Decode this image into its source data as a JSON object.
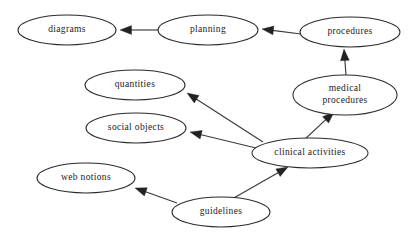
{
  "diagram": {
    "type": "directed-graph",
    "background_color": "#ffffff",
    "node_fill_color": "#ffffff",
    "node_stroke_color": "#2b2b2b",
    "edge_color": "#3a3a3a",
    "text_color": "#1a1a1a",
    "nodes": [
      {
        "id": "diagrams",
        "label": "diagrams",
        "lines": [
          "diagrams"
        ],
        "cx": 67,
        "cy": 30,
        "rx": 49,
        "ry": 15
      },
      {
        "id": "planning",
        "label": "planning",
        "lines": [
          "planning"
        ],
        "cx": 208,
        "cy": 30,
        "rx": 50,
        "ry": 15
      },
      {
        "id": "procedures",
        "label": "procedures",
        "lines": [
          "procedures"
        ],
        "cx": 350,
        "cy": 32,
        "rx": 50,
        "ry": 15
      },
      {
        "id": "medical-procedures",
        "label": "medical procedures",
        "lines": [
          "medical",
          "procedures"
        ],
        "cx": 345,
        "cy": 95,
        "rx": 52,
        "ry": 20
      },
      {
        "id": "quantities",
        "label": "quantities",
        "lines": [
          "quantities"
        ],
        "cx": 135,
        "cy": 85,
        "rx": 50,
        "ry": 15
      },
      {
        "id": "social-objects",
        "label": "social objects",
        "lines": [
          "social objects"
        ],
        "cx": 136,
        "cy": 128,
        "rx": 50,
        "ry": 15
      },
      {
        "id": "clinical-activities",
        "label": "clinical activities",
        "lines": [
          "clinical activities"
        ],
        "cx": 310,
        "cy": 153,
        "rx": 58,
        "ry": 15
      },
      {
        "id": "web-notions",
        "label": "web notions",
        "lines": [
          "web notions"
        ],
        "cx": 86,
        "cy": 178,
        "rx": 49,
        "ry": 15
      },
      {
        "id": "guidelines",
        "label": "guidelines",
        "lines": [
          "guidelines"
        ],
        "cx": 221,
        "cy": 212,
        "rx": 49,
        "ry": 15
      }
    ],
    "edges": [
      {
        "id": "planning-to-diagrams",
        "from": "planning",
        "to": "diagrams",
        "x1": 158,
        "y1": 30,
        "x2": 120,
        "y2": 30,
        "angle": 180
      },
      {
        "id": "procedures-to-planning",
        "from": "procedures",
        "to": "planning",
        "x1": 301,
        "y1": 34,
        "x2": 262,
        "y2": 29,
        "angle": 187
      },
      {
        "id": "medical-procedures-to-procedures",
        "from": "medical-procedures",
        "to": "procedures",
        "x1": 346,
        "y1": 75,
        "x2": 344,
        "y2": 49,
        "angle": 272
      },
      {
        "id": "clinical-activities-to-medical-procedures",
        "from": "clinical-activities",
        "to": "medical-procedures",
        "x1": 303,
        "y1": 141,
        "x2": 334,
        "y2": 112,
        "angle": 317
      },
      {
        "id": "clinical-activities-to-quantities",
        "from": "clinical-activities",
        "to": "quantities",
        "x1": 263,
        "y1": 142,
        "x2": 187,
        "y2": 93,
        "angle": 213
      },
      {
        "id": "clinical-activities-to-social-objects",
        "from": "clinical-activities",
        "to": "social-objects",
        "x1": 256,
        "y1": 148,
        "x2": 190,
        "y2": 132,
        "angle": 194
      },
      {
        "id": "guidelines-to-web-notions",
        "from": "guidelines",
        "to": "web-notions",
        "x1": 177,
        "y1": 203,
        "x2": 135,
        "y2": 188,
        "angle": 200
      },
      {
        "id": "guidelines-to-clinical-activities",
        "from": "guidelines",
        "to": "clinical-activities",
        "x1": 232,
        "y1": 199,
        "x2": 288,
        "y2": 167,
        "angle": 330
      }
    ]
  }
}
